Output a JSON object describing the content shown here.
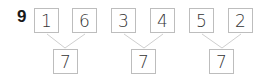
{
  "question": {
    "number": "9"
  },
  "groups": [
    {
      "parts": [
        "1",
        "6"
      ],
      "whole": "7"
    },
    {
      "parts": [
        "3",
        "4"
      ],
      "whole": "7"
    },
    {
      "parts": [
        "5",
        "2"
      ],
      "whole": "7"
    }
  ],
  "colors": {
    "box_border": "#bdbdbd",
    "line": "#cfcfcf",
    "text": "#333333"
  }
}
